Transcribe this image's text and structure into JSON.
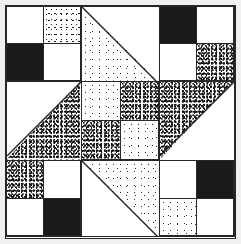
{
  "figure": {
    "width": 241,
    "height": 244,
    "background_color": "#f0f0ee",
    "line_color": "#272727",
    "border_inset_px": 5
  },
  "palette": {
    "white": "#ffffff",
    "black": "#1a1a1a",
    "stipple_light": "#ffffff",
    "stipple_medium": "#ffffff",
    "stipple_dark": "#ffffff"
  },
  "block": {
    "grid": "3x3",
    "columns_px": [
      75,
      78,
      75
    ],
    "rows_px": [
      75,
      79,
      76
    ],
    "units": [
      {
        "name": "top-left-four-patch",
        "kind": "four-patch",
        "position": "top-left",
        "patches": [
          "white",
          "stipple-medium",
          "black",
          "white"
        ]
      },
      {
        "name": "top-center-triangle",
        "kind": "half-square-triangle",
        "position": "top-center",
        "triangle_corner": "lower-left",
        "triangle_fill": "stipple-light",
        "background_fill": "white"
      },
      {
        "name": "top-right-four-patch",
        "kind": "four-patch",
        "position": "top-right",
        "patches": [
          "black",
          "white",
          "white",
          "stipple-dark"
        ]
      },
      {
        "name": "middle-left-triangle",
        "kind": "half-square-triangle",
        "position": "middle-left",
        "triangle_corner": "lower-right",
        "triangle_fill": "stipple-dark",
        "background_fill": "white"
      },
      {
        "name": "center-four-patch",
        "kind": "four-patch",
        "position": "center",
        "patches": [
          "stipple-light",
          "stipple-dark",
          "stipple-dark",
          "stipple-light"
        ]
      },
      {
        "name": "middle-right-triangle",
        "kind": "half-square-triangle",
        "position": "middle-right",
        "triangle_corner": "upper-left",
        "triangle_fill": "stipple-dark",
        "background_fill": "white"
      },
      {
        "name": "bottom-left-four-patch",
        "kind": "four-patch",
        "position": "bottom-left",
        "patches": [
          "stipple-dark",
          "white",
          "white",
          "black"
        ]
      },
      {
        "name": "bottom-center-triangle",
        "kind": "half-square-triangle",
        "position": "bottom-center",
        "triangle_corner": "upper-right",
        "triangle_fill": "stipple-light",
        "background_fill": "white"
      },
      {
        "name": "bottom-right-four-patch",
        "kind": "four-patch",
        "position": "bottom-right",
        "patches": [
          "white",
          "black",
          "stipple-light",
          "white"
        ]
      }
    ]
  }
}
